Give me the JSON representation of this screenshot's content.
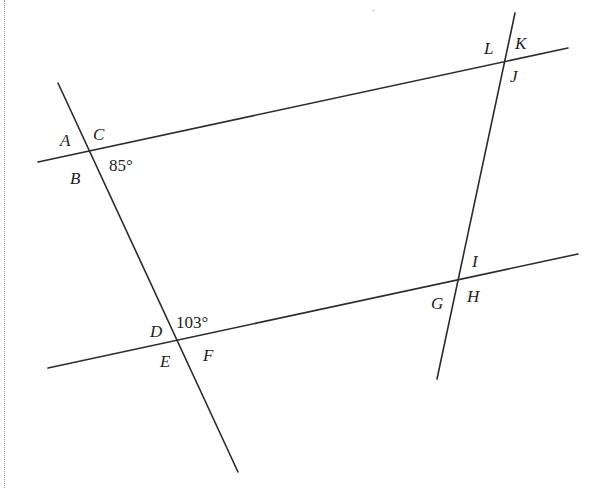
{
  "diagram": {
    "line_color": "#2b2b2b",
    "lines": [
      {
        "name": "top-transversal",
        "x1": 38,
        "y1": 162,
        "x2": 568,
        "y2": 48
      },
      {
        "name": "bottom-transversal",
        "x1": 48,
        "y1": 368,
        "x2": 578,
        "y2": 254
      },
      {
        "name": "left-line",
        "x1": 58,
        "y1": 83,
        "x2": 238,
        "y2": 472
      },
      {
        "name": "right-line",
        "x1": 515,
        "y1": 13,
        "x2": 437,
        "y2": 379
      }
    ],
    "intersections": {
      "top_left": {
        "labels": {
          "A": "A",
          "B": "B",
          "C": "C"
        },
        "angle_value": "85°"
      },
      "bottom_left": {
        "labels": {
          "D": "D",
          "E": "E",
          "F": "F"
        },
        "angle_value": "103°"
      },
      "bottom_right": {
        "labels": {
          "G": "G",
          "H": "H",
          "I": "I"
        }
      },
      "top_right": {
        "labels": {
          "J": "J",
          "K": "K",
          "L": "L"
        }
      }
    }
  }
}
